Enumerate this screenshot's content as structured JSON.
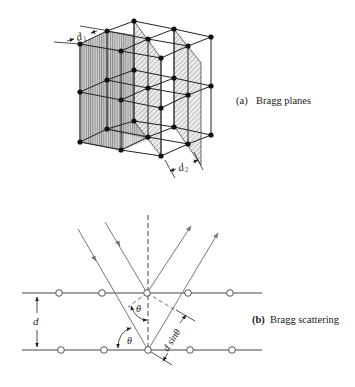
{
  "figure": {
    "part_a": {
      "tag": "(a)",
      "caption": "Bragg planes",
      "spacing_labels": [
        "d₁",
        "d₂"
      ]
    },
    "part_b": {
      "tag": "(b)",
      "caption": "Bragg scattering",
      "labels": {
        "spacing": "d",
        "angle": "θ",
        "path_difference": "d sinθ"
      }
    }
  },
  "colors": {
    "line": "#222222",
    "ray": "#777777",
    "plane_fill": "#b8b8b8",
    "node": "#111111"
  }
}
